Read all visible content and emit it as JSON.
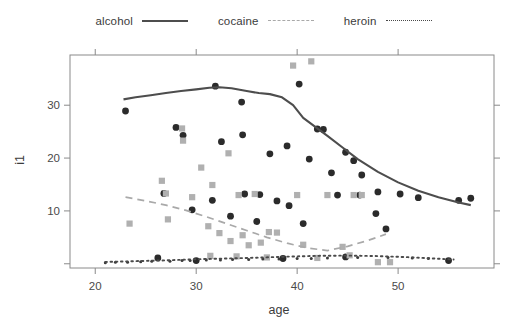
{
  "legend": {
    "position": "top-center",
    "entries": [
      {
        "label": "alcohol",
        "style": "solid",
        "color": "#4d4d4d"
      },
      {
        "label": "cocaine",
        "style": "dashed",
        "color": "#a9a9a9"
      },
      {
        "label": "heroin",
        "style": "dotted",
        "color": "#4a4a4a"
      }
    ]
  },
  "axes": {
    "xlabel": "age",
    "ylabel": "i1",
    "xticks": [
      "20",
      "30",
      "40",
      "50"
    ],
    "yticks": [
      "10",
      "20",
      "30"
    ]
  },
  "chart_data": {
    "type": "scatter",
    "title": "",
    "xlabel": "age",
    "ylabel": "i1",
    "xlim": [
      17.5,
      59.5
    ],
    "ylim": [
      -0.8,
      39.5
    ],
    "xticks": [
      20,
      30,
      40,
      50
    ],
    "yticks": [
      0,
      10,
      20,
      30
    ],
    "grid": false,
    "legend_position": "top-center",
    "series": [
      {
        "name": "alcohol",
        "style": "solid",
        "color": "#4d4d4d",
        "marker": "circle-dark",
        "smooth_line": {
          "x": [
            22.8,
            24.0,
            25.5,
            27.0,
            28.5,
            30.0,
            31.3,
            32.3,
            33.5,
            35.0,
            36.2,
            37.3,
            38.5,
            39.6,
            40.6,
            41.8,
            43.0,
            44.5,
            46.0,
            48.0,
            50.0,
            52.0,
            54.0,
            56.0,
            57.2
          ],
          "y": [
            31.1,
            31.5,
            31.9,
            32.3,
            32.7,
            33.0,
            33.3,
            33.4,
            33.2,
            32.7,
            32.3,
            32.1,
            31.5,
            30.0,
            27.6,
            25.9,
            24.2,
            22.0,
            19.8,
            17.4,
            15.4,
            13.8,
            12.6,
            11.6,
            11.1
          ]
        },
        "points": [
          {
            "x": 23.0,
            "y": 28.9
          },
          {
            "x": 28.0,
            "y": 25.8
          },
          {
            "x": 28.7,
            "y": 24.3
          },
          {
            "x": 31.9,
            "y": 33.6
          },
          {
            "x": 32.5,
            "y": 23.1
          },
          {
            "x": 34.5,
            "y": 30.6
          },
          {
            "x": 34.6,
            "y": 24.4
          },
          {
            "x": 37.3,
            "y": 20.8
          },
          {
            "x": 39.0,
            "y": 22.3
          },
          {
            "x": 40.2,
            "y": 34.0
          },
          {
            "x": 41.2,
            "y": 19.8
          },
          {
            "x": 42.0,
            "y": 25.5
          },
          {
            "x": 42.6,
            "y": 25.4
          },
          {
            "x": 43.4,
            "y": 17.2
          },
          {
            "x": 44.8,
            "y": 21.1
          },
          {
            "x": 45.6,
            "y": 19.5
          },
          {
            "x": 46.4,
            "y": 16.8
          },
          {
            "x": 48.0,
            "y": 13.6
          },
          {
            "x": 50.2,
            "y": 13.2
          },
          {
            "x": 56.0,
            "y": 12.0
          },
          {
            "x": 57.2,
            "y": 12.4
          },
          {
            "x": 26.8,
            "y": 13.3
          },
          {
            "x": 29.6,
            "y": 10.2
          },
          {
            "x": 31.6,
            "y": 12.0
          },
          {
            "x": 33.4,
            "y": 9.0
          },
          {
            "x": 34.8,
            "y": 13.2
          },
          {
            "x": 36.0,
            "y": 8.0
          },
          {
            "x": 36.3,
            "y": 13.1
          },
          {
            "x": 38.0,
            "y": 11.9
          },
          {
            "x": 39.2,
            "y": 11.0
          },
          {
            "x": 40.6,
            "y": 7.6
          },
          {
            "x": 44.0,
            "y": 13.0
          },
          {
            "x": 46.2,
            "y": 13.0
          },
          {
            "x": 47.8,
            "y": 9.5
          },
          {
            "x": 48.8,
            "y": 6.6
          },
          {
            "x": 52.0,
            "y": 12.5
          },
          {
            "x": 26.2,
            "y": 1.1
          },
          {
            "x": 30.0,
            "y": 0.6
          },
          {
            "x": 38.6,
            "y": 1.0
          },
          {
            "x": 44.8,
            "y": 1.3
          },
          {
            "x": 55.0,
            "y": 0.6
          }
        ]
      },
      {
        "name": "cocaine",
        "style": "dashed",
        "color": "#a9a9a9",
        "marker": "square-gray",
        "smooth_line": {
          "x": [
            23.0,
            25.0,
            27.0,
            29.0,
            31.0,
            33.0,
            35.0,
            37.0,
            39.0,
            41.0,
            43.0,
            45.0,
            47.0,
            48.8
          ],
          "y": [
            12.6,
            11.9,
            11.1,
            10.1,
            8.9,
            7.6,
            6.3,
            5.0,
            3.9,
            3.0,
            2.5,
            3.3,
            4.4,
            5.6
          ]
        },
        "points": [
          {
            "x": 23.4,
            "y": 7.6
          },
          {
            "x": 26.6,
            "y": 15.7
          },
          {
            "x": 27.0,
            "y": 13.3
          },
          {
            "x": 27.2,
            "y": 8.4
          },
          {
            "x": 28.6,
            "y": 25.6
          },
          {
            "x": 28.7,
            "y": 23.3
          },
          {
            "x": 29.6,
            "y": 12.6
          },
          {
            "x": 30.5,
            "y": 18.2
          },
          {
            "x": 31.2,
            "y": 7.1
          },
          {
            "x": 31.6,
            "y": 14.9
          },
          {
            "x": 32.3,
            "y": 5.8
          },
          {
            "x": 33.2,
            "y": 20.9
          },
          {
            "x": 33.4,
            "y": 4.3
          },
          {
            "x": 34.2,
            "y": 13.0
          },
          {
            "x": 34.6,
            "y": 5.4
          },
          {
            "x": 35.2,
            "y": 3.5
          },
          {
            "x": 35.8,
            "y": 13.2
          },
          {
            "x": 36.4,
            "y": 4.0
          },
          {
            "x": 37.2,
            "y": 6.0
          },
          {
            "x": 38.0,
            "y": 5.9
          },
          {
            "x": 39.6,
            "y": 37.5
          },
          {
            "x": 41.4,
            "y": 38.3
          },
          {
            "x": 40.0,
            "y": 13.0
          },
          {
            "x": 40.6,
            "y": 3.6
          },
          {
            "x": 43.0,
            "y": 13.0
          },
          {
            "x": 45.6,
            "y": 13.0
          },
          {
            "x": 46.4,
            "y": 13.0
          },
          {
            "x": 44.5,
            "y": 3.2
          },
          {
            "x": 45.2,
            "y": 1.6
          },
          {
            "x": 31.4,
            "y": 1.5
          },
          {
            "x": 34.0,
            "y": 1.4
          },
          {
            "x": 37.0,
            "y": 1.2
          },
          {
            "x": 42.0,
            "y": 1.1
          },
          {
            "x": 48.0,
            "y": 0.3
          },
          {
            "x": 49.2,
            "y": 0.3
          }
        ]
      },
      {
        "name": "heroin",
        "style": "dotted",
        "color": "#4a4a4a",
        "marker": "dot-small",
        "smooth_line": {
          "x": [
            21.0,
            24.0,
            27.0,
            30.0,
            33.0,
            36.0,
            39.0,
            42.0,
            45.0,
            48.0,
            51.0,
            54.0,
            55.5
          ],
          "y": [
            0.35,
            0.5,
            0.65,
            0.85,
            1.0,
            1.15,
            1.35,
            1.5,
            1.55,
            1.45,
            1.25,
            0.95,
            0.8
          ]
        },
        "points": [
          {
            "x": 21.0,
            "y": 0.2
          },
          {
            "x": 22.0,
            "y": 0.3
          },
          {
            "x": 23.2,
            "y": 0.3
          },
          {
            "x": 24.5,
            "y": 0.4
          },
          {
            "x": 25.6,
            "y": 0.5
          },
          {
            "x": 27.4,
            "y": 0.5
          },
          {
            "x": 28.6,
            "y": 0.6
          },
          {
            "x": 29.4,
            "y": 0.6
          },
          {
            "x": 31.0,
            "y": 0.7
          },
          {
            "x": 32.4,
            "y": 0.7
          },
          {
            "x": 33.6,
            "y": 0.8
          },
          {
            "x": 35.2,
            "y": 0.8
          },
          {
            "x": 36.6,
            "y": 0.9
          },
          {
            "x": 38.2,
            "y": 0.9
          },
          {
            "x": 40.0,
            "y": 1.0
          },
          {
            "x": 41.4,
            "y": 1.0
          },
          {
            "x": 43.0,
            "y": 1.1
          },
          {
            "x": 46.0,
            "y": 1.2
          },
          {
            "x": 49.0,
            "y": 1.2
          },
          {
            "x": 51.4,
            "y": 1.1
          },
          {
            "x": 53.0,
            "y": 1.0
          }
        ]
      }
    ]
  }
}
